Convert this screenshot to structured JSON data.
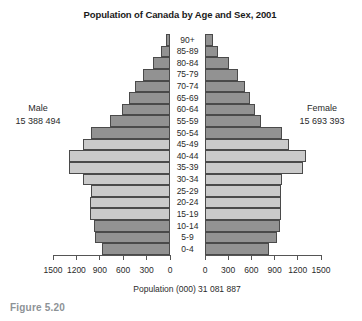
{
  "title": "Population of Canada by Age and Sex, 2001",
  "figure_caption": "Figure 5.20",
  "left_group": {
    "label": "Male",
    "total": "15 388 494"
  },
  "right_group": {
    "label": "Female",
    "total": "15 693 393"
  },
  "axis": {
    "caption": "Population (000) 31 081 887",
    "left_ticks": [
      "1500",
      "1200",
      "900",
      "600",
      "300",
      "0"
    ],
    "right_ticks": [
      "0",
      "300",
      "600",
      "900",
      "1200",
      "1500"
    ],
    "max_per_side": 1500
  },
  "colors": {
    "dark_bar": "#929292",
    "light_bar": "#cacaca",
    "bar_border": "#4a4a4a",
    "axis": "#555555",
    "figure_caption_text": "#8d9296"
  },
  "chart_data": {
    "type": "bar",
    "subtype": "population-pyramid",
    "title": "Population of Canada by Age and Sex, 2001",
    "xlabel": "Population (000) 31 081 887",
    "unit": "thousands of people",
    "x_range_each_side": [
      0,
      1500
    ],
    "x_tick_step": 300,
    "grid": false,
    "categories": [
      "90+",
      "85-89",
      "80-84",
      "75-79",
      "70-74",
      "65-69",
      "60-64",
      "55-59",
      "50-54",
      "45-49",
      "40-44",
      "35-39",
      "30-34",
      "25-29",
      "20-24",
      "15-19",
      "10-14",
      "5-9",
      "0-4"
    ],
    "row_shades": [
      "dark",
      "dark",
      "dark",
      "dark",
      "dark",
      "dark",
      "dark",
      "dark",
      "dark",
      "light",
      "light",
      "light",
      "light",
      "light",
      "light",
      "light",
      "dark",
      "dark",
      "dark"
    ],
    "series": [
      {
        "name": "Male",
        "side": "left",
        "total_label": "15 388 494",
        "values": [
          55,
          115,
          220,
          340,
          455,
          525,
          610,
          770,
          1010,
          1120,
          1300,
          1290,
          1120,
          1010,
          1025,
          1025,
          980,
          960,
          875
        ]
      },
      {
        "name": "Female",
        "side": "right",
        "total_label": "15 693 393",
        "values": [
          105,
          165,
          310,
          425,
          515,
          580,
          650,
          730,
          995,
          1090,
          1300,
          1265,
          990,
          985,
          985,
          985,
          965,
          935,
          825
        ]
      }
    ]
  }
}
